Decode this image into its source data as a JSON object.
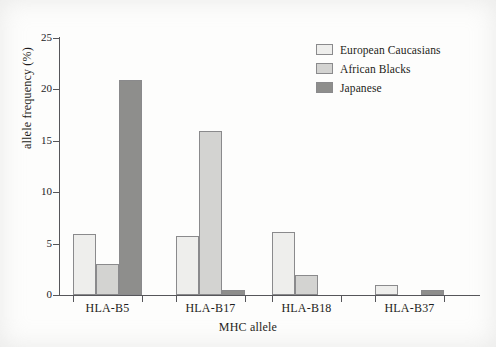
{
  "chart_data": {
    "type": "bar",
    "title": "",
    "xlabel": "MHC allele",
    "ylabel": "allele frequency (%)",
    "categories": [
      "HLA-B5",
      "HLA-B17",
      "HLA-B18",
      "HLA-B37"
    ],
    "series": [
      {
        "name": "European Caucasians",
        "color": "#eeeeec",
        "values": [
          5.9,
          5.7,
          6.1,
          1.0
        ]
      },
      {
        "name": "African Blacks",
        "color": "#d3d3d1",
        "values": [
          3.0,
          16.0,
          1.9,
          0
        ]
      },
      {
        "name": "Japanese",
        "color": "#8e8e8c",
        "values": [
          20.9,
          0.5,
          0,
          0.5
        ]
      }
    ],
    "ylim": [
      0,
      25
    ],
    "yticks": [
      0,
      5,
      10,
      15,
      20,
      25
    ],
    "ytick_labels": [
      "0",
      "5",
      "10",
      "15",
      "20",
      "25"
    ],
    "grid": false,
    "legend_position": "top-right"
  },
  "legend": {
    "items": [
      {
        "label": "European Caucasians",
        "color": "#eeeeec"
      },
      {
        "label": "African Blacks",
        "color": "#d3d3d1"
      },
      {
        "label": "Japanese",
        "color": "#8e8e8c"
      }
    ]
  },
  "axes": {
    "y_label": "allele frequency (%)",
    "x_label": "MHC allele",
    "y_tick_labels": [
      "25",
      "20",
      "15",
      "10",
      "5",
      "0"
    ],
    "x_tick_labels": [
      "HLA-B5",
      "HLA-B17",
      "HLA-B18",
      "HLA-B37"
    ]
  }
}
